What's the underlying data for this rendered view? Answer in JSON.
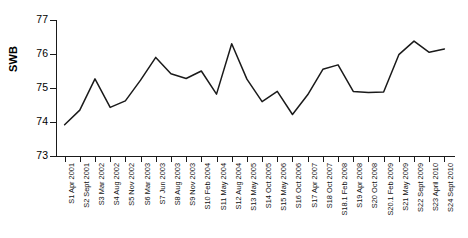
{
  "chart_data": {
    "type": "line",
    "title": "",
    "xlabel": "",
    "ylabel": "SWB",
    "ylim": [
      73,
      77
    ],
    "yticks": [
      73,
      74,
      75,
      76,
      77
    ],
    "grid": false,
    "legend": null,
    "line_color": "#1a1a1a",
    "categories": [
      "S1 Apr 2001",
      "S2 Sept 2001",
      "S3 Mar 2002",
      "S4 Aug 2002",
      "S5 Nov 2002",
      "S6 Mar 2003",
      "S7 Jun 2003",
      "S8 Aug 2003",
      "S9 Nov 2003",
      "S10 Feb 2004",
      "S11 May 2004",
      "S12 Aug 2004",
      "S13 May 2005",
      "S14 Oct 2005",
      "S15 May 2006",
      "S16 Oct 2006",
      "S17 Apr 2007",
      "S18 Oct 2007",
      "S18.1 Feb 2008",
      "S19 Apr 2008",
      "S20 Oct 2008",
      "S20.1 Feb 2009",
      "S21 May 2009",
      "S22 Sept 2009",
      "S23 April 2010",
      "S24 Sept 2010"
    ],
    "series": [
      {
        "name": "SWB",
        "values": [
          73.92,
          74.35,
          75.27,
          74.43,
          74.62,
          75.23,
          75.9,
          75.42,
          75.28,
          75.5,
          74.82,
          76.3,
          75.26,
          74.6,
          74.9,
          74.22,
          74.8,
          75.55,
          75.68,
          74.9,
          74.87,
          74.88,
          75.98,
          76.38,
          76.05,
          76.15
        ]
      }
    ]
  },
  "axis": {
    "y_title": "SWB"
  }
}
